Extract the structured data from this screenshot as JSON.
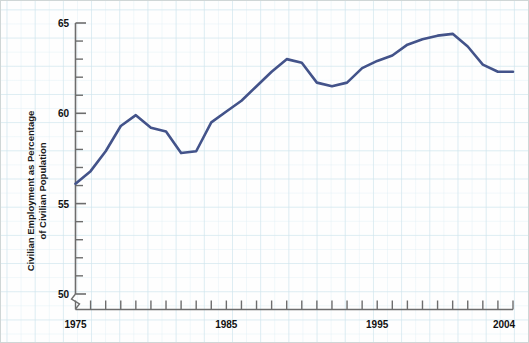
{
  "chart_data": {
    "type": "line",
    "title": "",
    "xlabel": "",
    "ylabel": "Civilian Employment as Percentage of Civilian Population",
    "ylabel_line1": "Civilian Employment as Percentage",
    "ylabel_line2": "of Civilian Population",
    "ylim": [
      50,
      65
    ],
    "xlim": [
      1975,
      2004
    ],
    "y_major_ticks": [
      50,
      55,
      60,
      65
    ],
    "y_major_tick_labels": [
      "50",
      "55",
      "60",
      "65"
    ],
    "y_minor_tick_step": 1,
    "x_tick_step": 1,
    "x_labeled_ticks": [
      1975,
      1985,
      1995,
      2004
    ],
    "x_tick_labels": [
      "1975",
      "1985",
      "1995",
      "2004"
    ],
    "grid": true,
    "grid_color": "#b9dbe8",
    "legend": "none",
    "axis_break_y": true,
    "line_color": "#43538a",
    "line_width": 2.6,
    "series": [
      {
        "name": "Civilian Employment as Percentage of Civilian Population",
        "x": [
          1975,
          1976,
          1977,
          1978,
          1979,
          1980,
          1981,
          1982,
          1983,
          1984,
          1985,
          1986,
          1987,
          1988,
          1989,
          1990,
          1991,
          1992,
          1993,
          1994,
          1995,
          1996,
          1997,
          1998,
          1999,
          2000,
          2001,
          2002,
          2003,
          2004
        ],
        "values": [
          56.1,
          56.8,
          57.9,
          59.3,
          59.9,
          59.2,
          59.0,
          57.8,
          57.9,
          59.5,
          60.1,
          60.7,
          61.5,
          62.3,
          63.0,
          62.8,
          61.7,
          61.5,
          61.7,
          62.5,
          62.9,
          63.2,
          63.8,
          64.1,
          64.3,
          64.4,
          63.7,
          62.7,
          62.3,
          62.3
        ]
      }
    ]
  },
  "axes": {
    "y_label_line1": "Civilian Employment as Percentage",
    "y_label_line2": "of Civilian Population",
    "y_ticks": [
      "65",
      "60",
      "55",
      "50"
    ],
    "x_ticks": [
      "1975",
      "1985",
      "1995",
      "2004"
    ]
  }
}
